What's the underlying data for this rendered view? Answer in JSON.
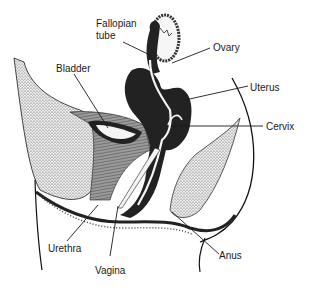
{
  "diagram": {
    "labels": [
      {
        "id": "fallopian-tube",
        "line1": "Fallopian",
        "line2": "tube"
      },
      {
        "id": "ovary",
        "text": "Ovary"
      },
      {
        "id": "bladder",
        "text": "Bladder"
      },
      {
        "id": "uterus",
        "text": "Uterus"
      },
      {
        "id": "cervix",
        "text": "Cervix"
      },
      {
        "id": "urethra",
        "text": "Urethra"
      },
      {
        "id": "vagina",
        "text": "Vagina"
      },
      {
        "id": "anus",
        "text": "Anus"
      }
    ],
    "colors": {
      "ink": "#1a1a1a",
      "dark_tissue": "#222222",
      "stipple": "#cfcfcf",
      "hatched": "#8a8a8a",
      "background": "#ffffff"
    }
  }
}
